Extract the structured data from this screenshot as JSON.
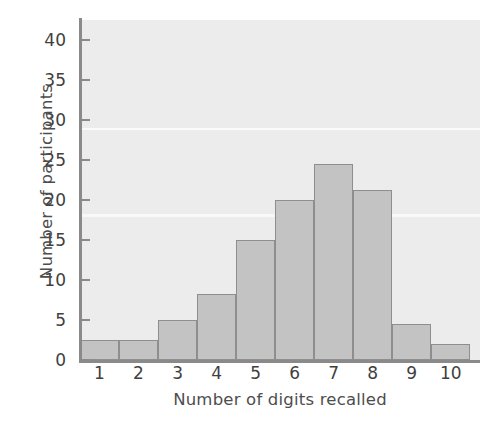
{
  "chart_data": {
    "type": "bar",
    "title": "",
    "subtitle": "",
    "xlabel": "Number of digits recalled",
    "ylabel": "Number of participants",
    "categories": [
      "1",
      "2",
      "3",
      "4",
      "5",
      "6",
      "7",
      "8",
      "9",
      "10"
    ],
    "values": [
      2.5,
      2.5,
      5,
      8.2,
      15,
      20,
      24.5,
      21.3,
      4.5,
      2
    ],
    "series": [
      {
        "name": "Number of participants",
        "values": [
          2.5,
          2.5,
          5,
          8.2,
          15,
          20,
          24.5,
          21.3,
          4.5,
          2
        ]
      }
    ],
    "ylim": [
      0,
      42
    ],
    "xlim": [
      0.5,
      10.5
    ],
    "ytick_labels": [
      "0",
      "5",
      "10",
      "15",
      "20",
      "25",
      "30",
      "35",
      "40"
    ],
    "ytick_values": [
      0,
      5,
      10,
      15,
      20,
      25,
      30,
      35,
      40
    ],
    "xtick_labels": [
      "1",
      "2",
      "3",
      "4",
      "5",
      "6",
      "7",
      "8",
      "9",
      "10"
    ],
    "grid": false,
    "legend": null,
    "legend_position": "none",
    "annotations": [],
    "bar_fill_color": "#c3c3c3",
    "bar_edge_color": "#8e8e8e",
    "plot_background_color": "#ececec",
    "axis_color": "#8a8a8a",
    "text_color": "#3f3f3f"
  }
}
